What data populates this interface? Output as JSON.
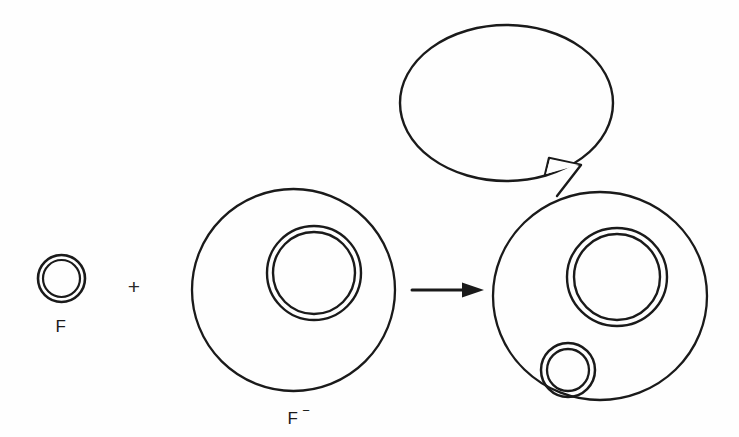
{
  "figure": {
    "type": "diagram",
    "background_color": "#fefefe",
    "ink_color": "#1a1a1a",
    "width": 739,
    "height": 437
  },
  "labels": {
    "donor_plasmid": "F",
    "recipient_cell": "F",
    "recipient_cell_superscript": "−",
    "operator": "+",
    "speech_bubble_text": ""
  },
  "shapes": {
    "f_plasmid": {
      "name": "F",
      "cx": 61.5,
      "cy": 278.5,
      "outer_rx": 23.5,
      "outer_ry": 23.5,
      "inner_rx": 18.5,
      "inner_ry": 18.5,
      "label_x": 61,
      "label_y": 332
    },
    "plus_sign": {
      "x": 134,
      "y": 294
    },
    "recipient_cell": {
      "name": "F-",
      "cx": 293.5,
      "cy": 290,
      "rx": 101.5,
      "ry": 101,
      "label_x": 293,
      "label_y": 424,
      "superscript_x": 308,
      "superscript_y": 415
    },
    "recipient_nucleus": {
      "cx": 314,
      "cy": 273,
      "outer_rx": 47,
      "outer_ry": 47,
      "inner_rx": 41,
      "inner_ry": 41
    },
    "arrow": {
      "x1": 412,
      "x2": 482,
      "y": 290,
      "head_width": 22,
      "head_height": 15
    },
    "product_cell": {
      "name": "F+",
      "cx": 600,
      "cy": 296,
      "rx": 107,
      "ry": 104
    },
    "product_nucleus": {
      "cx": 617,
      "cy": 277,
      "outer_rx": 50,
      "outer_ry": 49,
      "inner_rx": 43,
      "inner_ry": 43
    },
    "transferred_plasmid": {
      "cx": 568,
      "cy": 370,
      "outer_rx": 27,
      "outer_ry": 27,
      "inner_rx": 21,
      "inner_ry": 21
    },
    "speech_bubble": {
      "cx": 506.5,
      "cy": 103,
      "rx": 106.5,
      "ry": 78,
      "tail_points": "543,177 549,159 580,164 557,196",
      "text_x": 506,
      "text_y": 108
    }
  }
}
